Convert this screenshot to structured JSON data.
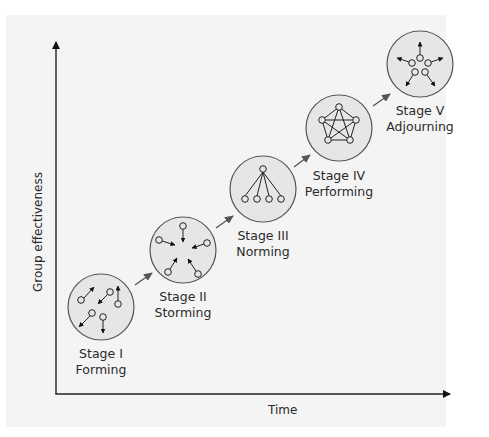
{
  "diagram": {
    "type": "stage-progression",
    "x_axis_label": "Time",
    "y_axis_label": "Group effectiveness",
    "colors": {
      "background": "#f4f4f4",
      "circle_fill": "#e6e6e6",
      "circle_stroke": "#555555",
      "node_fill": "#e6e6e6",
      "line": "#222222",
      "arrow": "#555555"
    },
    "stages": [
      {
        "title": "Stage I",
        "name": "Forming",
        "icon": "scattered-nodes-icon"
      },
      {
        "title": "Stage II",
        "name": "Storming",
        "icon": "converging-nodes-icon"
      },
      {
        "title": "Stage III",
        "name": "Norming",
        "icon": "hierarchy-nodes-icon"
      },
      {
        "title": "Stage IV",
        "name": "Performing",
        "icon": "fully-connected-nodes-icon"
      },
      {
        "title": "Stage V",
        "name": "Adjourning",
        "icon": "dispersing-nodes-icon"
      }
    ]
  }
}
